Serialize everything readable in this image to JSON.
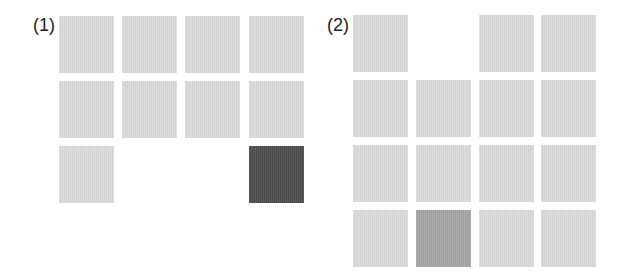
{
  "panels": [
    {
      "label": "(1)",
      "label_pos": [
        33,
        16
      ],
      "cells": [
        {
          "x": 59,
          "y": 16,
          "color": "#d9d9d9"
        },
        {
          "x": 122,
          "y": 16,
          "color": "#d9d9d9"
        },
        {
          "x": 185,
          "y": 16,
          "color": "#d9d9d9"
        },
        {
          "x": 249,
          "y": 16,
          "color": "#d9d9d9"
        },
        {
          "x": 59,
          "y": 81,
          "color": "#d9d9d9"
        },
        {
          "x": 122,
          "y": 81,
          "color": "#d9d9d9"
        },
        {
          "x": 185,
          "y": 81,
          "color": "#d9d9d9"
        },
        {
          "x": 249,
          "y": 81,
          "color": "#d9d9d9"
        },
        {
          "x": 59,
          "y": 146,
          "color": "#d9d9d9"
        },
        {
          "x": 249,
          "y": 146,
          "color": "#4a4a4a"
        }
      ]
    },
    {
      "label": "(2)",
      "label_pos": [
        327,
        16
      ],
      "cells": [
        {
          "x": 353,
          "y": 15,
          "color": "#d9d9d9"
        },
        {
          "x": 479,
          "y": 15,
          "color": "#d9d9d9"
        },
        {
          "x": 541,
          "y": 15,
          "color": "#d9d9d9"
        },
        {
          "x": 353,
          "y": 80,
          "color": "#d9d9d9"
        },
        {
          "x": 416,
          "y": 80,
          "color": "#d9d9d9"
        },
        {
          "x": 479,
          "y": 80,
          "color": "#d9d9d9"
        },
        {
          "x": 541,
          "y": 80,
          "color": "#d9d9d9"
        },
        {
          "x": 353,
          "y": 145,
          "color": "#d9d9d9"
        },
        {
          "x": 416,
          "y": 145,
          "color": "#d9d9d9"
        },
        {
          "x": 479,
          "y": 145,
          "color": "#d9d9d9"
        },
        {
          "x": 541,
          "y": 145,
          "color": "#d9d9d9"
        },
        {
          "x": 353,
          "y": 210,
          "color": "#d9d9d9"
        },
        {
          "x": 416,
          "y": 210,
          "color": "#a3a3a3"
        },
        {
          "x": 479,
          "y": 210,
          "color": "#d9d9d9"
        },
        {
          "x": 541,
          "y": 210,
          "color": "#d9d9d9"
        }
      ]
    }
  ]
}
